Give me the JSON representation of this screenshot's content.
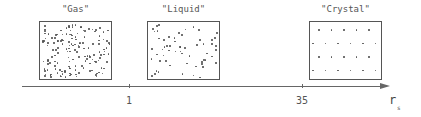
{
  "diagram": {
    "phases": [
      {
        "id": "gas",
        "label": "\"Gas\"",
        "box": {
          "x": 39,
          "y": 21,
          "w": 73,
          "h": 59
        },
        "arrangement": "dense-random",
        "dot_count": 160
      },
      {
        "id": "liquid",
        "label": "\"Liquid\"",
        "box": {
          "x": 147,
          "y": 21,
          "w": 73,
          "h": 59
        },
        "arrangement": "sparse-random",
        "dot_count": 60
      },
      {
        "id": "crystal",
        "label": "\"Crystal\"",
        "box": {
          "x": 309,
          "y": 21,
          "w": 73,
          "h": 59
        },
        "arrangement": "lattice",
        "rows": 4,
        "cols": 5
      }
    ],
    "axis": {
      "label": "r",
      "subscript": "s",
      "ticks": [
        {
          "value": "1",
          "x": 129
        },
        {
          "value": "35",
          "x": 302
        }
      ]
    },
    "colors": {
      "stroke": "#555555",
      "dot": "#555555",
      "background": "#ffffff"
    }
  }
}
